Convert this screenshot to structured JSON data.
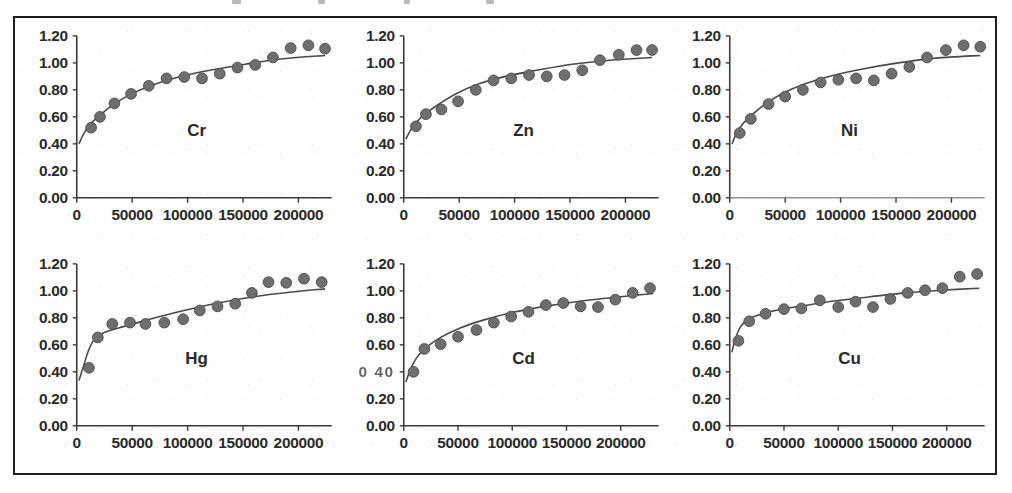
{
  "figure": {
    "border_color": "#1d1d1d",
    "background_color": "#ffffff",
    "marker_color": "#6e6e6e",
    "curve_color": "#4a4a4a",
    "axis_color": "#3a3a3a",
    "panel_count": 6,
    "layout": "2 rows x 3 columns"
  },
  "axes": {
    "y_ticks": [
      "1.20",
      "1.00",
      "0.80",
      "0.60",
      "0.40",
      "0.20",
      "0.00"
    ],
    "x_ticks": [
      "0",
      "50000",
      "100000",
      "150000",
      "200000"
    ],
    "y_min": 0.0,
    "y_max": 1.2,
    "x_min": 0,
    "x_max": 230000
  },
  "chart_data": [
    {
      "type": "scatter",
      "title": "Cr",
      "xlabel": "",
      "ylabel": "",
      "xlim": [
        0,
        230000
      ],
      "ylim": [
        0,
        1.2
      ],
      "grid": false,
      "legend": "none",
      "x": [
        13000,
        21000,
        34000,
        49000,
        65000,
        81000,
        97000,
        113000,
        129000,
        145000,
        161000,
        177000,
        193000,
        209000,
        224000
      ],
      "values": [
        0.52,
        0.6,
        0.7,
        0.77,
        0.83,
        0.885,
        0.895,
        0.885,
        0.92,
        0.965,
        0.985,
        1.04,
        1.11,
        1.13,
        1.105
      ],
      "fit_curve": {
        "x": [
          2000,
          6000,
          12000,
          20000,
          32000,
          48000,
          68000,
          92000,
          120000,
          152000,
          186000,
          224000
        ],
        "y": [
          0.4,
          0.47,
          0.545,
          0.605,
          0.685,
          0.765,
          0.835,
          0.895,
          0.945,
          0.99,
          1.03,
          1.055
        ]
      }
    },
    {
      "type": "scatter",
      "title": "Zn",
      "xlabel": "",
      "ylabel": "",
      "xlim": [
        0,
        230000
      ],
      "ylim": [
        0,
        1.2
      ],
      "grid": false,
      "legend": "none",
      "x": [
        11000,
        20000,
        34000,
        49000,
        65000,
        81000,
        97000,
        113000,
        129000,
        145000,
        161000,
        177000,
        194000,
        210000,
        224000
      ],
      "values": [
        0.53,
        0.62,
        0.655,
        0.715,
        0.8,
        0.87,
        0.885,
        0.91,
        0.9,
        0.91,
        0.945,
        1.02,
        1.06,
        1.095,
        1.095
      ],
      "fit_curve": {
        "x": [
          2000,
          6000,
          12000,
          20000,
          32000,
          48000,
          68000,
          92000,
          120000,
          152000,
          186000,
          224000
        ],
        "y": [
          0.435,
          0.5,
          0.565,
          0.625,
          0.695,
          0.775,
          0.845,
          0.9,
          0.945,
          0.99,
          1.02,
          1.04
        ]
      }
    },
    {
      "type": "scatter",
      "title": "Ni",
      "xlabel": "",
      "ylabel": "",
      "xlim": [
        0,
        230000
      ],
      "ylim": [
        0,
        1.2
      ],
      "grid": false,
      "legend": "none",
      "x": [
        9000,
        19000,
        35000,
        50000,
        66000,
        82000,
        98000,
        114000,
        130000,
        146000,
        162000,
        178000,
        195000,
        211000,
        226000
      ],
      "values": [
        0.48,
        0.585,
        0.695,
        0.75,
        0.8,
        0.855,
        0.875,
        0.885,
        0.87,
        0.92,
        0.97,
        1.04,
        1.095,
        1.13,
        1.12
      ],
      "fit_curve": {
        "x": [
          2000,
          6000,
          12000,
          20000,
          32000,
          48000,
          68000,
          92000,
          120000,
          152000,
          186000,
          226000
        ],
        "y": [
          0.4,
          0.475,
          0.55,
          0.615,
          0.695,
          0.775,
          0.845,
          0.905,
          0.955,
          1.0,
          1.035,
          1.055
        ]
      }
    },
    {
      "type": "scatter",
      "title": "Hg",
      "xlabel": "",
      "ylabel": "",
      "xlim": [
        0,
        230000
      ],
      "ylim": [
        0,
        1.2
      ],
      "grid": false,
      "legend": "none",
      "x": [
        11000,
        19000,
        32000,
        48000,
        62000,
        79000,
        96000,
        111000,
        127000,
        143000,
        158000,
        173000,
        189000,
        205000,
        221000
      ],
      "values": [
        0.43,
        0.655,
        0.755,
        0.765,
        0.755,
        0.765,
        0.79,
        0.855,
        0.885,
        0.905,
        0.985,
        1.065,
        1.06,
        1.09,
        1.065
      ],
      "fit_curve": {
        "x": [
          2000,
          6000,
          11000,
          17000,
          26000,
          42000,
          64000,
          92000,
          124000,
          158000,
          192000,
          224000
        ],
        "y": [
          0.335,
          0.44,
          0.565,
          0.655,
          0.695,
          0.735,
          0.785,
          0.845,
          0.905,
          0.955,
          0.99,
          1.015
        ]
      }
    },
    {
      "type": "scatter",
      "title": "Cd",
      "xlabel": "",
      "ylabel": "",
      "xlim": [
        0,
        235000
      ],
      "ylim": [
        0,
        1.2
      ],
      "grid": false,
      "legend": "none",
      "x": [
        9000,
        19000,
        34000,
        50000,
        67000,
        83000,
        99000,
        115000,
        131000,
        147000,
        163000,
        179000,
        195000,
        211000,
        227000
      ],
      "values": [
        0.4,
        0.57,
        0.605,
        0.66,
        0.71,
        0.765,
        0.81,
        0.845,
        0.895,
        0.91,
        0.885,
        0.88,
        0.935,
        0.985,
        1.02
      ],
      "fit_curve": {
        "x": [
          2000,
          6000,
          12000,
          20000,
          34000,
          52000,
          74000,
          100000,
          130000,
          164000,
          198000,
          230000
        ],
        "y": [
          0.325,
          0.415,
          0.505,
          0.575,
          0.655,
          0.725,
          0.785,
          0.84,
          0.885,
          0.925,
          0.955,
          0.98
        ]
      }
    },
    {
      "type": "scatter",
      "title": "Cu",
      "xlabel": "",
      "ylabel": "",
      "xlim": [
        0,
        235000
      ],
      "ylim": [
        0,
        1.2
      ],
      "grid": false,
      "legend": "none",
      "x": [
        8000,
        18000,
        33000,
        50000,
        66000,
        83000,
        100000,
        116000,
        132000,
        148000,
        164000,
        180000,
        196000,
        212000,
        228000
      ],
      "values": [
        0.63,
        0.775,
        0.83,
        0.865,
        0.87,
        0.93,
        0.88,
        0.92,
        0.88,
        0.94,
        0.985,
        1.005,
        1.02,
        1.105,
        1.125
      ],
      "fit_curve": {
        "x": [
          2000,
          5000,
          10000,
          17000,
          28000,
          45000,
          68000,
          96000,
          128000,
          162000,
          196000,
          230000
        ],
        "y": [
          0.545,
          0.64,
          0.735,
          0.79,
          0.825,
          0.86,
          0.89,
          0.925,
          0.955,
          0.985,
          1.005,
          1.02
        ]
      }
    }
  ],
  "notes": {
    "cd_degraded_label": "0 40"
  }
}
